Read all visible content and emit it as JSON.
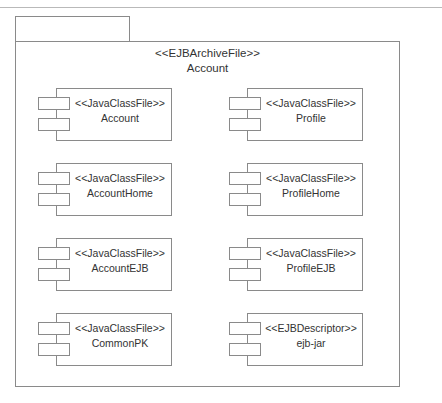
{
  "diagram": {
    "type": "uml-component-diagram",
    "canvas": {
      "width": 442,
      "height": 403
    },
    "colors": {
      "background": "#ffffff",
      "line": "#8a8a8a",
      "text": "#333333",
      "scan_rule": "#b9b9b9"
    }
  },
  "package": {
    "stereotype": "<<EJBArchiveFile>>",
    "name": "Account"
  },
  "components": [
    {
      "stereotype": "<<JavaClassFile>>",
      "name": "Account",
      "column": "left",
      "row": 1,
      "x": 38,
      "y": 88
    },
    {
      "stereotype": "<<JavaClassFile>>",
      "name": "Profile",
      "column": "right",
      "row": 1,
      "x": 229,
      "y": 88
    },
    {
      "stereotype": "<<JavaClassFile>>",
      "name": "AccountHome",
      "column": "left",
      "row": 2,
      "x": 38,
      "y": 163
    },
    {
      "stereotype": "<<JavaClassFile>>",
      "name": "ProfileHome",
      "column": "right",
      "row": 2,
      "x": 229,
      "y": 163
    },
    {
      "stereotype": "<<JavaClassFile>>",
      "name": "AccountEJB",
      "column": "left",
      "row": 3,
      "x": 38,
      "y": 238
    },
    {
      "stereotype": "<<JavaClassFile>>",
      "name": "ProfileEJB",
      "column": "right",
      "row": 3,
      "x": 229,
      "y": 238
    },
    {
      "stereotype": "<<JavaClassFile>>",
      "name": "CommonPK",
      "column": "left",
      "row": 4,
      "x": 38,
      "y": 313
    },
    {
      "stereotype": "<<EJBDescriptor>>",
      "name": "ejb-jar",
      "column": "right",
      "row": 4,
      "x": 229,
      "y": 313
    }
  ]
}
